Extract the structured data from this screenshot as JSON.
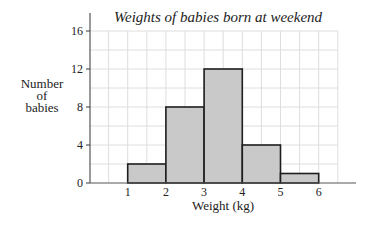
{
  "chart_data": {
    "type": "bar",
    "subtype": "histogram",
    "title": "Weights of babies born at weekend",
    "xlabel": "Weight (kg)",
    "ylabel": [
      "Number",
      "of",
      "babies"
    ],
    "bins": [
      {
        "from": 1,
        "to": 2,
        "value": 2
      },
      {
        "from": 2,
        "to": 3,
        "value": 8
      },
      {
        "from": 3,
        "to": 4,
        "value": 12
      },
      {
        "from": 4,
        "to": 5,
        "value": 4
      },
      {
        "from": 5,
        "to": 6,
        "value": 1
      }
    ],
    "categories": [
      "1-2",
      "2-3",
      "3-4",
      "4-5",
      "5-6"
    ],
    "values": [
      2,
      8,
      12,
      4,
      1
    ],
    "xticks": [
      "1",
      "2",
      "3",
      "4",
      "5",
      "6"
    ],
    "yticks": [
      "0",
      "4",
      "8",
      "12",
      "16"
    ],
    "xlim": [
      0,
      6.5
    ],
    "ylim": [
      0,
      16
    ],
    "grid": true,
    "legend": null
  },
  "colors": {
    "bar_fill": "#c9c9c9",
    "bar_stroke": "#1e1e1e",
    "grid": "#dedede",
    "axis": "#555555"
  }
}
